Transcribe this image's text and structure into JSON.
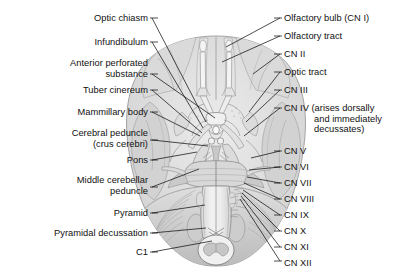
{
  "figure": {
    "background_color": "#ffffff",
    "line_color": "#111111",
    "art_colors": {
      "brain_light": "#e6e6e6",
      "brain_mid": "#cfcfcf",
      "brain_dark": "#b5b5b5",
      "brain_outline": "#8f8f8f",
      "stem_light": "#ededed",
      "vessel": "#9a9a9a"
    }
  },
  "labels_left": [
    {
      "id": "optic-chiasm",
      "text": "Optic chiasm",
      "x": 148,
      "y": 13,
      "lines": [
        "Optic chiasm"
      ]
    },
    {
      "id": "infundibulum",
      "text": "Infundibulum",
      "x": 148,
      "y": 37,
      "lines": [
        "Infundibulum"
      ]
    },
    {
      "id": "anterior-perforated-substance",
      "text": "Anterior perforated substance",
      "x": 148,
      "y": 58,
      "lines": [
        "Anterior perforated",
        "substance"
      ]
    },
    {
      "id": "tuber-cinereum",
      "text": "Tuber cinereum",
      "x": 148,
      "y": 85,
      "lines": [
        "Tuber cinereum"
      ]
    },
    {
      "id": "mammillary-body",
      "text": "Mammillary body",
      "x": 148,
      "y": 107,
      "lines": [
        "Mammillary body"
      ]
    },
    {
      "id": "cerebral-peduncle",
      "text": "Cerebral peduncle (crus cerebri)",
      "x": 148,
      "y": 128,
      "lines": [
        "Cerebral peduncle",
        "(crus cerebri)"
      ]
    },
    {
      "id": "pons",
      "text": "Pons",
      "x": 148,
      "y": 155,
      "lines": [
        "Pons"
      ]
    },
    {
      "id": "middle-cerebellar-peduncle",
      "text": "Middle cerebellar peduncle",
      "x": 148,
      "y": 175,
      "lines": [
        "Middle cerebellar",
        "peduncle"
      ]
    },
    {
      "id": "pyramid",
      "text": "Pyramid",
      "x": 148,
      "y": 208,
      "lines": [
        "Pyramid"
      ]
    },
    {
      "id": "pyramidal-decussation",
      "text": "Pyramidal decussation",
      "x": 148,
      "y": 228,
      "lines": [
        "Pyramidal decussation"
      ]
    },
    {
      "id": "c1",
      "text": "C1",
      "x": 148,
      "y": 247,
      "lines": [
        "C1"
      ]
    }
  ],
  "labels_right": [
    {
      "id": "olfactory-bulb",
      "text": "Olfactory bulb (CN I)",
      "x": 284,
      "y": 13,
      "lines": [
        "Olfactory bulb (CN I)"
      ]
    },
    {
      "id": "olfactory-tract",
      "text": "Olfactory tract",
      "x": 284,
      "y": 31,
      "lines": [
        "Olfactory tract"
      ]
    },
    {
      "id": "cn-2",
      "text": "CN II",
      "x": 284,
      "y": 49,
      "lines": [
        "CN II"
      ]
    },
    {
      "id": "optic-tract",
      "text": "Optic tract",
      "x": 284,
      "y": 67,
      "lines": [
        "Optic tract"
      ]
    },
    {
      "id": "cn-3",
      "text": "CN III",
      "x": 284,
      "y": 85,
      "lines": [
        "CN III"
      ]
    },
    {
      "id": "cn-4",
      "text": "CN IV (arises dorsally and immediately decussates)",
      "x": 284,
      "y": 103,
      "lines": [
        "CN IV (arises dorsally",
        "and immediately",
        "decussates)"
      ],
      "indent": 2
    },
    {
      "id": "cn-5",
      "text": "CN V",
      "x": 284,
      "y": 146,
      "lines": [
        "CN V"
      ]
    },
    {
      "id": "cn-6",
      "text": "CN VI",
      "x": 284,
      "y": 162,
      "lines": [
        "CN VI"
      ]
    },
    {
      "id": "cn-7",
      "text": "CN VII",
      "x": 284,
      "y": 178,
      "lines": [
        "CN VII"
      ]
    },
    {
      "id": "cn-8",
      "text": "CN VIII",
      "x": 284,
      "y": 194,
      "lines": [
        "CN VIII"
      ]
    },
    {
      "id": "cn-9",
      "text": "CN IX",
      "x": 284,
      "y": 210,
      "lines": [
        "CN IX"
      ]
    },
    {
      "id": "cn-10",
      "text": "CN X",
      "x": 284,
      "y": 226,
      "lines": [
        "CN X"
      ]
    },
    {
      "id": "cn-11",
      "text": "CN XI",
      "x": 284,
      "y": 242,
      "lines": [
        "CN XI"
      ]
    },
    {
      "id": "cn-12",
      "text": "CN XII",
      "x": 284,
      "y": 258,
      "lines": [
        "CN XII"
      ]
    }
  ],
  "leaders_left": [
    {
      "id": "leader-optic-chiasm",
      "from": [
        152,
        18
      ],
      "to": [
        206,
        122
      ]
    },
    {
      "id": "leader-infundibulum",
      "from": [
        152,
        42
      ],
      "to": [
        203,
        128
      ]
    },
    {
      "id": "leader-anterior-perforated",
      "from": [
        152,
        74
      ],
      "to": [
        215,
        118
      ]
    },
    {
      "id": "leader-tuber-cinereum",
      "from": [
        152,
        90
      ],
      "to": [
        202,
        133
      ]
    },
    {
      "id": "leader-mammillary-body",
      "from": [
        152,
        112
      ],
      "to": [
        200,
        136
      ]
    },
    {
      "id": "leader-cerebral-peduncle",
      "from": [
        152,
        140
      ],
      "to": [
        208,
        146
      ]
    },
    {
      "id": "leader-pons",
      "from": [
        152,
        160
      ],
      "to": [
        197,
        152
      ]
    },
    {
      "id": "leader-middle-cerebellar-ped",
      "from": [
        152,
        187
      ],
      "to": [
        199,
        169
      ]
    },
    {
      "id": "leader-pyramid",
      "from": [
        152,
        213
      ],
      "to": [
        205,
        205
      ]
    },
    {
      "id": "leader-pyramidal-decussation",
      "from": [
        152,
        233
      ],
      "to": [
        206,
        228
      ]
    },
    {
      "id": "leader-c1",
      "from": [
        152,
        252
      ],
      "to": [
        212,
        241
      ]
    }
  ],
  "leaders_right": [
    {
      "id": "leader-olfactory-bulb",
      "from": [
        280,
        18
      ],
      "to": [
        226,
        47
      ]
    },
    {
      "id": "leader-olfactory-tract",
      "from": [
        280,
        36
      ],
      "to": [
        222,
        62
      ]
    },
    {
      "id": "leader-cn-2",
      "from": [
        280,
        54
      ],
      "to": [
        253,
        74
      ]
    },
    {
      "id": "leader-optic-tract",
      "from": [
        280,
        72
      ],
      "to": [
        249,
        112
      ]
    },
    {
      "id": "leader-cn-3",
      "from": [
        280,
        90
      ],
      "to": [
        246,
        122
      ]
    },
    {
      "id": "leader-cn-4",
      "from": [
        280,
        108
      ],
      "to": [
        244,
        136
      ]
    },
    {
      "id": "leader-cn-5",
      "from": [
        280,
        151
      ],
      "to": [
        251,
        158
      ]
    },
    {
      "id": "leader-cn-6",
      "from": [
        280,
        167
      ],
      "to": [
        249,
        170
      ]
    },
    {
      "id": "leader-cn-7",
      "from": [
        280,
        183
      ],
      "to": [
        247,
        177
      ]
    },
    {
      "id": "leader-cn-8",
      "from": [
        280,
        199
      ],
      "to": [
        244,
        183
      ]
    },
    {
      "id": "leader-cn-9",
      "from": [
        280,
        215
      ],
      "to": [
        243,
        190
      ]
    },
    {
      "id": "leader-cn-10",
      "from": [
        280,
        231
      ],
      "to": [
        242,
        193
      ]
    },
    {
      "id": "leader-cn-11",
      "from": [
        280,
        247
      ],
      "to": [
        241,
        196
      ]
    },
    {
      "id": "leader-cn-12",
      "from": [
        280,
        261
      ],
      "to": [
        240,
        199
      ]
    }
  ]
}
